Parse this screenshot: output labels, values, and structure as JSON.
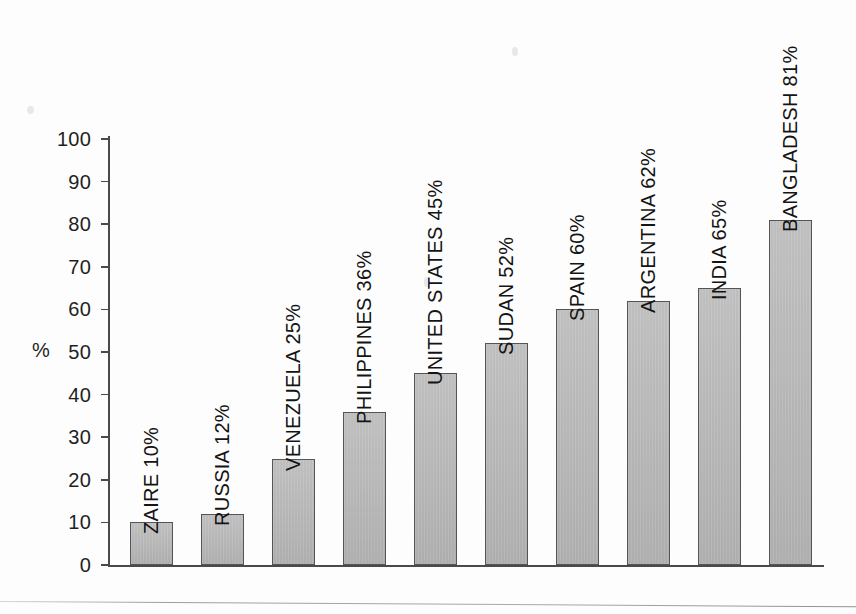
{
  "chart_data": {
    "type": "bar",
    "title": "",
    "subtitle": "",
    "xlabel": "",
    "ylabel": "%",
    "ylim": [
      0,
      100
    ],
    "grid": false,
    "legend": null,
    "orientation": "vertical",
    "bar_label_rotation": "vertical-bottom-to-top",
    "categories": [
      "ZAIRE",
      "RUSSIA",
      "VENEZUELA",
      "PHILIPPINES",
      "UNITED STATES",
      "SUDAN",
      "SPAIN",
      "ARGENTINA",
      "INDIA",
      "BANGLADESH"
    ],
    "values": [
      10,
      12,
      25,
      36,
      45,
      52,
      60,
      62,
      65,
      81
    ],
    "bar_labels": [
      "ZAIRE 10%",
      "RUSSIA 12%",
      "VENEZUELA 25%",
      "PHILIPPINES 36%",
      "UNITED STATES 45%",
      "SUDAN 52%",
      "SPAIN 60%",
      "ARGENTINA 62%",
      "INDIA 65%",
      "BANGLADESH 81%"
    ],
    "yticks": [
      0,
      10,
      20,
      30,
      40,
      50,
      60,
      70,
      80,
      90,
      100
    ],
    "ytick_labels": [
      "0",
      "10",
      "20",
      "30",
      "40",
      "50",
      "60",
      "70",
      "80",
      "90",
      "100"
    ],
    "colors": {
      "bar_fill": "#b7b7b7",
      "bar_stroke": "#555555",
      "axis": "#4a4a4a",
      "text": "#1a1a1a",
      "background": "#fdfdfd"
    }
  },
  "axis": {
    "unit_label": "%"
  }
}
